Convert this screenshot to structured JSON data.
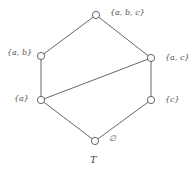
{
  "diagram": {
    "type": "hasse-diagram",
    "caption": "T",
    "colors": {
      "line": "#555555",
      "node_fill": "#ffffff",
      "text": "#555555"
    },
    "nodes": [
      {
        "id": "abc",
        "label": "{a, b, c}",
        "x": 96,
        "y": 15
      },
      {
        "id": "ab",
        "label": "{a, b}",
        "x": 41,
        "y": 56
      },
      {
        "id": "ac",
        "label": "{a, c}",
        "x": 151,
        "y": 58
      },
      {
        "id": "a",
        "label": "{a}",
        "x": 41,
        "y": 100
      },
      {
        "id": "c",
        "label": "{c}",
        "x": 151,
        "y": 100
      },
      {
        "id": "empty",
        "label": "∅",
        "x": 95,
        "y": 141
      }
    ],
    "edges": [
      {
        "from": "abc",
        "to": "ab"
      },
      {
        "from": "abc",
        "to": "ac"
      },
      {
        "from": "ab",
        "to": "a"
      },
      {
        "from": "ac",
        "to": "a"
      },
      {
        "from": "ac",
        "to": "c"
      },
      {
        "from": "a",
        "to": "empty"
      },
      {
        "from": "c",
        "to": "empty"
      }
    ]
  }
}
